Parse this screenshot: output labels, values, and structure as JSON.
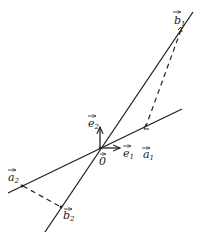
{
  "diagram": {
    "type": "vector-geometry",
    "colors": {
      "ink": "#222222",
      "background": "#ffffff"
    },
    "origin": {
      "label": "0",
      "x": 100,
      "y": 148
    },
    "basis": [
      {
        "id": "e1",
        "label": "e",
        "sub": "1",
        "direction": "right"
      },
      {
        "id": "e2",
        "label": "e",
        "sub": "2",
        "direction": "up"
      }
    ],
    "lines": [
      {
        "id": "line-a",
        "through": [
          "a1",
          "a2"
        ]
      },
      {
        "id": "line-b",
        "through": [
          "b1",
          "b2"
        ]
      }
    ],
    "points": [
      {
        "id": "a1",
        "label": "a",
        "sub": "1"
      },
      {
        "id": "a2",
        "label": "a",
        "sub": "2"
      },
      {
        "id": "b1",
        "label": "b",
        "sub": "1"
      },
      {
        "id": "b2",
        "label": "b",
        "sub": "2"
      }
    ],
    "dashed_segments": [
      {
        "from": "b1",
        "to": "a1"
      },
      {
        "from": "a2",
        "to": "b2"
      }
    ]
  }
}
